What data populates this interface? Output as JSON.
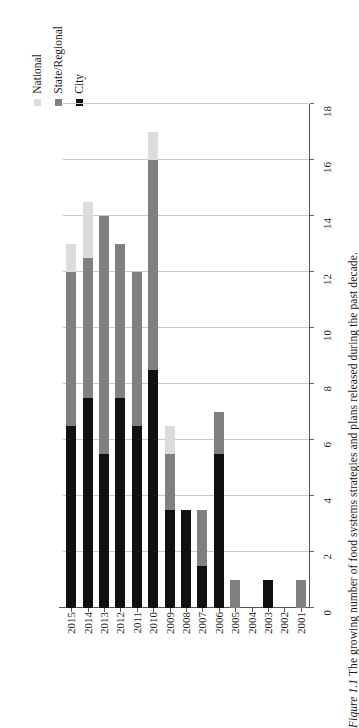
{
  "caption": {
    "figure_number": "Figure 1.1",
    "text": "The growing number of food systems strategies and plans released during the past decade."
  },
  "legend": {
    "position": "top-left",
    "items": [
      {
        "label": "National",
        "color": "#dcdcdc"
      },
      {
        "label": "State/Regional",
        "color": "#808080"
      },
      {
        "label": "City",
        "color": "#111111"
      }
    ]
  },
  "axis": {
    "y_title": "",
    "x_title": "",
    "value_ticks": [
      "0",
      "2",
      "4",
      "6",
      "8",
      "10",
      "12",
      "14",
      "16",
      "18"
    ],
    "category_ticks": [
      "2001",
      "2002",
      "2003",
      "2004",
      "2005",
      "2006",
      "2007",
      "2008",
      "2009",
      "2010",
      "2011",
      "2012",
      "2013",
      "2014",
      "2015"
    ]
  },
  "chart_data": {
    "type": "bar",
    "orientation": "horizontal-stacked",
    "title": "",
    "subtitle": "",
    "xlabel": "",
    "ylabel": "",
    "xlim": [
      0,
      18
    ],
    "xticks": [
      0,
      2,
      4,
      6,
      8,
      10,
      12,
      14,
      16,
      18
    ],
    "grid": true,
    "legend_position": "top-left",
    "stacked": true,
    "categories": [
      "2001",
      "2002",
      "2003",
      "2004",
      "2005",
      "2006",
      "2007",
      "2008",
      "2009",
      "2010",
      "2011",
      "2012",
      "2013",
      "2014",
      "2015"
    ],
    "series": [
      {
        "name": "City",
        "color": "#111111",
        "values": [
          0,
          0,
          1,
          0,
          0,
          5.5,
          1.5,
          3.5,
          3.5,
          8.5,
          6.5,
          7.5,
          5.5,
          7.5,
          6.5
        ]
      },
      {
        "name": "State/Regional",
        "color": "#808080",
        "values": [
          1,
          0,
          0,
          0,
          1,
          1.5,
          2,
          0,
          2,
          7.5,
          5.5,
          5.5,
          8.5,
          5,
          5.5
        ]
      },
      {
        "name": "National",
        "color": "#dcdcdc",
        "values": [
          0,
          0,
          0,
          0,
          0,
          0,
          0,
          0,
          1,
          1,
          0,
          0,
          0,
          2,
          1
        ]
      }
    ],
    "totals": [
      1,
      0,
      1,
      0,
      1,
      7,
      3.5,
      3.5,
      6.5,
      17,
      12,
      13,
      14,
      14.5,
      13
    ]
  }
}
